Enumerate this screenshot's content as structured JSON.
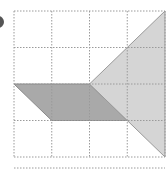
{
  "diagram": {
    "type": "grid-geometry",
    "grid": {
      "cols": 4,
      "rows": 4,
      "origin_x": 14,
      "origin_y": 11,
      "cell_w": 37.75,
      "cell_h": 36.5,
      "line_color": "#9a9a9a"
    },
    "shapes": [
      {
        "name": "parallelogram",
        "fill": "#a9a9a9",
        "stroke": "#8a8a8a",
        "grid_points": [
          [
            0,
            2
          ],
          [
            2,
            2
          ],
          [
            3,
            3
          ],
          [
            1,
            3
          ]
        ]
      },
      {
        "name": "triangle",
        "fill": "#d5d5d5",
        "stroke": "#9a9a9a",
        "grid_points": [
          [
            2,
            2
          ],
          [
            4,
            0
          ],
          [
            4,
            4
          ]
        ]
      }
    ],
    "partial_grid_line_y": 168,
    "marker_color": "#555555"
  }
}
